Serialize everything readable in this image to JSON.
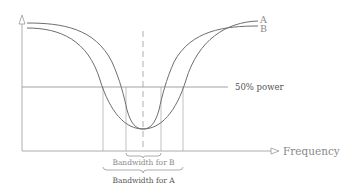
{
  "diagram": {
    "title": "",
    "x_axis_label": "Frequency",
    "y_axis_label": "",
    "reference_line_label": "50% power",
    "curves": [
      {
        "name": "A",
        "label": "A",
        "description": "wider response curve"
      },
      {
        "name": "B",
        "label": "B",
        "description": "narrower response curve"
      }
    ],
    "bandwidth_labels": {
      "b": "Bandwidth for B",
      "a": "Bandwidth for A"
    },
    "colors": {
      "curves": "#6e6e6e",
      "axes": "#9a9a9a",
      "labels": "#8a8a8a",
      "label_dark": "#555555"
    }
  }
}
